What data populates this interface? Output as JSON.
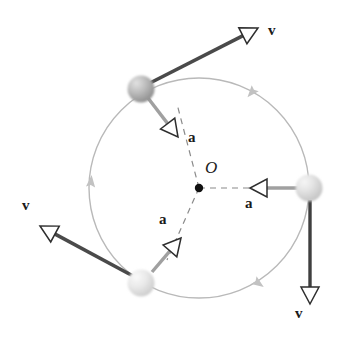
{
  "figure": {
    "type": "physics-vector-diagram",
    "background_color": "#ffffff",
    "width": 342,
    "height": 338
  },
  "circle": {
    "center_label": "O",
    "center_x": 199,
    "center_y": 188,
    "radius": 110,
    "stroke_color": "#b9b9b9",
    "stroke_width": 1.4,
    "center_dot_color": "#111111",
    "center_dot_radius": 4.2,
    "center_label_x": 205,
    "center_label_y": 159
  },
  "direction_markers": [
    {
      "name": "arc-direction-upper-right",
      "x": 252,
      "y": 92,
      "angle_deg": 130,
      "color": "#c2c2c2"
    },
    {
      "name": "arc-direction-left",
      "x": 91,
      "y": 182,
      "angle_deg": -85,
      "color": "#c2c2c2"
    },
    {
      "name": "arc-direction-lower-right",
      "x": 258,
      "y": 283,
      "angle_deg": 35,
      "color": "#c2c2c2"
    }
  ],
  "particles": [
    {
      "name": "particle-upper-left",
      "cx": 141,
      "cy": 89,
      "r": 13.5,
      "fill_light": "#d8d8d8",
      "fill_mid": "#b4b4b4",
      "fill_dark": "#8e8e8e"
    },
    {
      "name": "particle-right",
      "cx": 309,
      "cy": 188,
      "r": 13.5,
      "fill_light": "#ededed",
      "fill_mid": "#dcdcdc",
      "fill_dark": "#c4c4c4"
    },
    {
      "name": "particle-lower-left",
      "cx": 141,
      "cy": 283,
      "r": 13.5,
      "fill_light": "#f0f0f0",
      "fill_mid": "#e2e2e2",
      "fill_dark": "#cbcbcb"
    }
  ],
  "velocity_vectors": [
    {
      "name": "velocity-upper-right",
      "label": "v",
      "x1": 150,
      "y1": 83,
      "x2": 258,
      "y2": 28,
      "color": "#4a4a4a",
      "width": 3.6,
      "label_x": 268,
      "label_y": 23
    },
    {
      "name": "velocity-bottom-right",
      "label": "v",
      "x1": 310,
      "y1": 200,
      "x2": 310,
      "y2": 304,
      "color": "#3f3f3f",
      "width": 3.4,
      "label_x": 295,
      "label_y": 306
    },
    {
      "name": "velocity-lower-left",
      "label": "v",
      "x1": 133,
      "y1": 276,
      "x2": 40,
      "y2": 226,
      "color": "#4a4a4a",
      "width": 3.6,
      "label_x": 22,
      "label_y": 198
    }
  ],
  "acceleration_vectors": [
    {
      "name": "acceleration-upper-left",
      "label": "a",
      "x1": 148,
      "y1": 98,
      "x2": 178,
      "y2": 137,
      "color": "#a0a0a0",
      "width": 3.4,
      "label_x": 188,
      "label_y": 130
    },
    {
      "name": "acceleration-right",
      "label": "a",
      "x1": 298,
      "y1": 188,
      "x2": 250,
      "y2": 188,
      "color": "#a0a0a0",
      "width": 3.4,
      "label_x": 245,
      "label_y": 196
    },
    {
      "name": "acceleration-lower-left",
      "label": "a",
      "x1": 152,
      "y1": 272,
      "x2": 181,
      "y2": 238,
      "color": "#a0a0a0",
      "width": 3.4,
      "label_x": 159,
      "label_y": 212
    }
  ],
  "radius_lines": [
    {
      "name": "radius-line-upper-left",
      "x1": 199,
      "y1": 188,
      "x2": 177,
      "y2": 104
    },
    {
      "name": "radius-line-right",
      "x1": 199,
      "y1": 188,
      "x2": 284,
      "y2": 188
    },
    {
      "name": "radius-line-lower-left",
      "x1": 199,
      "y1": 188,
      "x2": 167,
      "y2": 260
    }
  ],
  "dashed_style": {
    "color": "#8a8a8a",
    "width": 1.2,
    "dash": "6,5"
  },
  "arrowhead_style": {
    "fill": "#ffffff",
    "stroke": "#2e2e2e",
    "stroke_width": 1.5,
    "length": 17,
    "half_width": 9
  }
}
